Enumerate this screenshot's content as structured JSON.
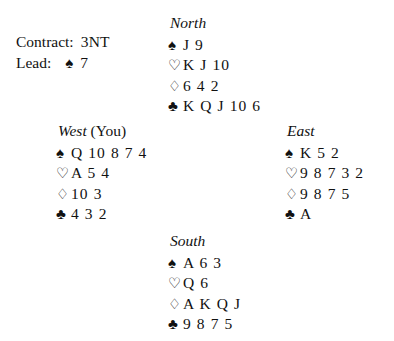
{
  "deal": {
    "contract": {
      "contract_label": "Contract:",
      "contract_value": "3NT",
      "lead_label": "Lead:",
      "lead_suit_symbol": "♠",
      "lead_card": "7"
    },
    "hands": {
      "north": {
        "label": "North",
        "you_tag": "",
        "suits": [
          {
            "suit": "spades",
            "symbol": "♠",
            "cards": "J 9"
          },
          {
            "suit": "hearts",
            "symbol": "♡",
            "cards": "K J 10"
          },
          {
            "suit": "diamonds",
            "symbol": "♢",
            "cards": "6 4 2"
          },
          {
            "suit": "clubs",
            "symbol": "♣",
            "cards": "K Q J 10 6"
          }
        ]
      },
      "west": {
        "label": "West",
        "you_tag": "(You)",
        "suits": [
          {
            "suit": "spades",
            "symbol": "♠",
            "cards": "Q 10 8 7 4"
          },
          {
            "suit": "hearts",
            "symbol": "♡",
            "cards": "A 5 4"
          },
          {
            "suit": "diamonds",
            "symbol": "♢",
            "cards": "10 3"
          },
          {
            "suit": "clubs",
            "symbol": "♣",
            "cards": "4 3 2"
          }
        ]
      },
      "east": {
        "label": "East",
        "you_tag": "",
        "suits": [
          {
            "suit": "spades",
            "symbol": "♠",
            "cards": "K 5 2"
          },
          {
            "suit": "hearts",
            "symbol": "♡",
            "cards": "9 8 7 3 2"
          },
          {
            "suit": "diamonds",
            "symbol": "♢",
            "cards": "9 8 7 5"
          },
          {
            "suit": "clubs",
            "symbol": "♣",
            "cards": "A"
          }
        ]
      },
      "south": {
        "label": "South",
        "you_tag": "",
        "suits": [
          {
            "suit": "spades",
            "symbol": "♠",
            "cards": "A 6 3"
          },
          {
            "suit": "hearts",
            "symbol": "♡",
            "cards": "Q 6"
          },
          {
            "suit": "diamonds",
            "symbol": "♢",
            "cards": "A K Q J"
          },
          {
            "suit": "clubs",
            "symbol": "♣",
            "cards": "9 8 7 5"
          }
        ]
      }
    },
    "colors": {
      "ink": "#111111",
      "background": "#ffffff"
    }
  }
}
